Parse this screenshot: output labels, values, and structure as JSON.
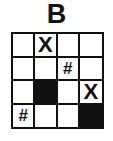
{
  "title": "B",
  "grid": {
    "rows": 4,
    "cols": 4,
    "cells": [
      [
        {
          "type": "empty",
          "symbol": ""
        },
        {
          "type": "symbol",
          "symbol": "X"
        },
        {
          "type": "empty",
          "symbol": ""
        },
        {
          "type": "empty",
          "symbol": ""
        }
      ],
      [
        {
          "type": "empty",
          "symbol": ""
        },
        {
          "type": "empty",
          "symbol": ""
        },
        {
          "type": "symbol",
          "symbol": "#"
        },
        {
          "type": "empty",
          "symbol": ""
        }
      ],
      [
        {
          "type": "empty",
          "symbol": ""
        },
        {
          "type": "filled",
          "symbol": ""
        },
        {
          "type": "empty",
          "symbol": ""
        },
        {
          "type": "symbol",
          "symbol": "X"
        }
      ],
      [
        {
          "type": "symbol",
          "symbol": "#"
        },
        {
          "type": "empty",
          "symbol": ""
        },
        {
          "type": "empty",
          "symbol": ""
        },
        {
          "type": "filled",
          "symbol": ""
        }
      ]
    ]
  },
  "colors": {
    "line": "#111111",
    "fill": "#111111",
    "background": "#ffffff"
  }
}
